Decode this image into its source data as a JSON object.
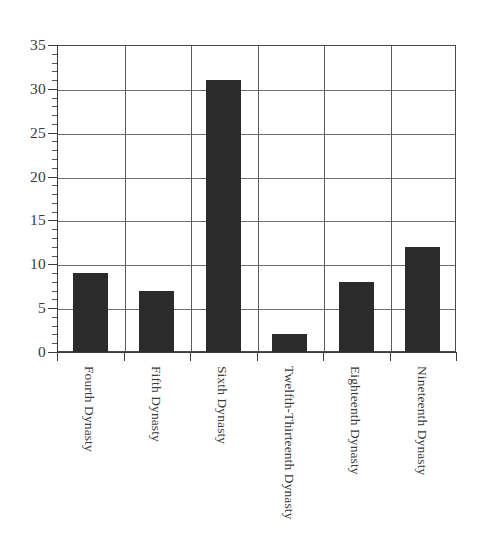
{
  "chart_data": {
    "type": "bar",
    "title": "",
    "subtitle": "",
    "xlabel": "",
    "ylabel": "",
    "categories": [
      "Fourth Dynasty",
      "Fifth Dynasty",
      "Sixth Dynasty",
      "Twelfth-Thirteenth Dynasty",
      "Eighteenth Dynasty",
      "Nineteenth Dynasty"
    ],
    "values": [
      9,
      7,
      31,
      2,
      8,
      12
    ],
    "ylim": [
      0,
      35
    ],
    "y_ticks": [
      0,
      5,
      10,
      15,
      20,
      25,
      30,
      35
    ],
    "y_tick_labels": [
      "0",
      "5",
      "10",
      "15",
      "20",
      "25",
      "30",
      "35"
    ],
    "y_minor_tick_step": 1,
    "grid": {
      "horizontal": true,
      "vertical": true
    },
    "legend": null,
    "legend_position": "none",
    "bar_color": "#2b2b2b",
    "axis_color": "#3d3d3d",
    "grid_color": "#6e6e6e",
    "background_color": "#ffffff"
  }
}
